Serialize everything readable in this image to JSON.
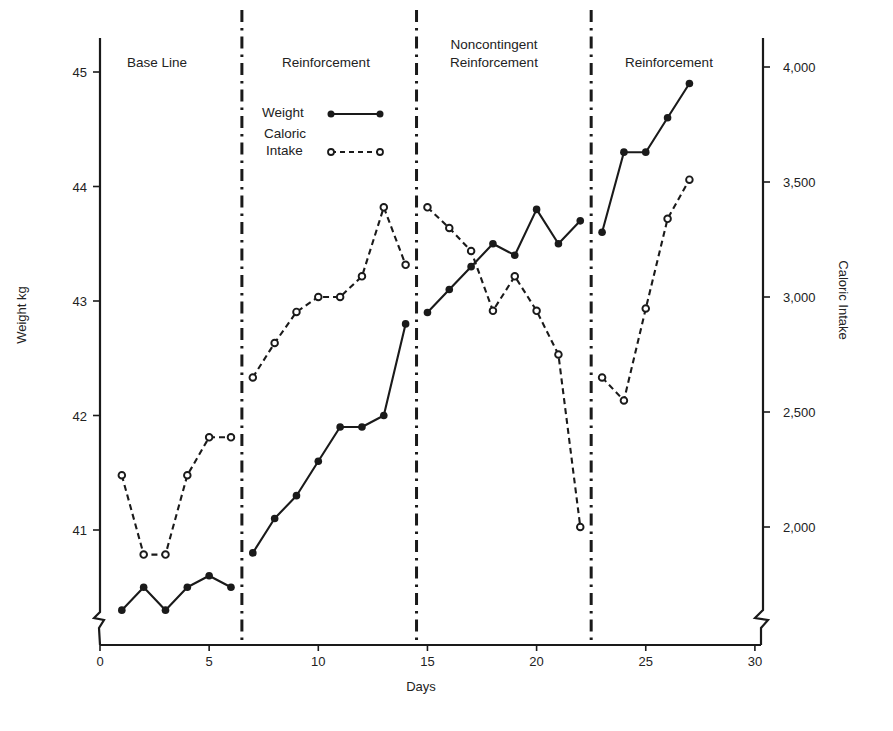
{
  "chart_data": {
    "type": "line",
    "title": "",
    "xlabel": "Days",
    "ylabel": "Weight kg",
    "y2label": "Caloric Intake",
    "xlim": [
      0,
      30
    ],
    "ylim": [
      40.0,
      45.3
    ],
    "y2lim": [
      1620,
      4060
    ],
    "x_ticks": [
      0,
      5,
      10,
      15,
      20,
      25,
      30
    ],
    "y_ticks": [
      41,
      42,
      43,
      44,
      45
    ],
    "y2_ticks": [
      2000,
      2500,
      3000,
      3500,
      4000
    ],
    "y2_tick_labels": [
      "2,000",
      "2,500",
      "3,000",
      "3,500",
      "4,000"
    ],
    "grid": false,
    "axis_breaks": [
      "left-bottom",
      "right-bottom"
    ],
    "phases": [
      {
        "label": "Base Line",
        "start": 0.5,
        "end": 6.5
      },
      {
        "label": "Reinforcement",
        "start": 6.5,
        "end": 14.5
      },
      {
        "label": "Noncontingent Reinforcement",
        "label_lines": [
          "Noncontingent",
          "Reinforcement"
        ],
        "start": 14.5,
        "end": 22.5
      },
      {
        "label": "Reinforcement",
        "start": 22.5,
        "end": 30
      }
    ],
    "phase_dividers": [
      6.5,
      14.5,
      22.5
    ],
    "legend": {
      "position": "upper-left-inside (Reinforcement phase)",
      "entries": [
        {
          "label": "Weight",
          "style": "solid line, filled circles"
        },
        {
          "label": "Caloric Intake",
          "label_lines": [
            "Caloric",
            "Intake"
          ],
          "style": "dashed line, open circles"
        }
      ]
    },
    "series": [
      {
        "name": "Weight",
        "axis": "left",
        "unit": "kg",
        "segments": [
          {
            "x": [
              1,
              2,
              3,
              4,
              5,
              6
            ],
            "y": [
              40.3,
              40.5,
              40.3,
              40.5,
              40.6,
              40.5
            ]
          },
          {
            "x": [
              7,
              8,
              9,
              10,
              11,
              12,
              13,
              14
            ],
            "y": [
              40.8,
              41.1,
              41.3,
              41.6,
              41.9,
              41.9,
              42.0,
              42.8
            ]
          },
          {
            "x": [
              15,
              16,
              17,
              18,
              19,
              20,
              21,
              22
            ],
            "y": [
              42.9,
              43.1,
              43.3,
              43.5,
              43.4,
              43.8,
              43.5,
              43.7
            ]
          },
          {
            "x": [
              23,
              24,
              25,
              26,
              27
            ],
            "y": [
              43.6,
              44.3,
              44.3,
              44.6,
              44.9
            ]
          }
        ]
      },
      {
        "name": "Caloric Intake",
        "axis": "right",
        "unit": "calories",
        "segments": [
          {
            "x": [
              1,
              2,
              3,
              4,
              5,
              6
            ],
            "y": [
              2225,
              1880,
              1880,
              2225,
              2390,
              2390
            ]
          },
          {
            "x": [
              7,
              8,
              9,
              10,
              11,
              12,
              13,
              14
            ],
            "y": [
              2650,
              2800,
              2935,
              3000,
              3000,
              3090,
              3390,
              3140
            ]
          },
          {
            "x": [
              15,
              16,
              17,
              18,
              19,
              20,
              21,
              22
            ],
            "y": [
              3390,
              3300,
              3200,
              2940,
              3090,
              2940,
              2750,
              2000
            ]
          },
          {
            "x": [
              23,
              24,
              25,
              26,
              27
            ],
            "y": [
              2650,
              2550,
              2950,
              3340,
              3510
            ]
          }
        ]
      }
    ]
  },
  "labels": {
    "xlabel": "Days",
    "ylabel": "Weight kg",
    "y2label": "Caloric Intake",
    "phase1": "Base Line",
    "phase2": "Reinforcement",
    "phase3_line1": "Noncontingent",
    "phase3_line2": "Reinforcement",
    "phase4": "Reinforcement",
    "legend_weight": "Weight",
    "legend_cal_line1": "Caloric",
    "legend_cal_line2": "Intake"
  },
  "colors": {
    "ink": "#1a1a1a",
    "background": "#ffffff"
  }
}
